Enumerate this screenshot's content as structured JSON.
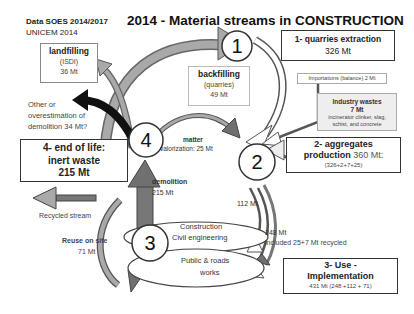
{
  "source": {
    "line1": "Data SOES 2014/2017",
    "line2": "UNICEM 2014"
  },
  "title": "2014 - Material streams in CONSTRUCTION",
  "nodes": {
    "n1": {
      "number": "1",
      "title": "1- quarries extraction",
      "value": "326 Mt"
    },
    "n2": {
      "number": "2",
      "title1": "2- aggregates",
      "title2": "production",
      "value": "360 Mt:",
      "formula": "(326+2+7+25)"
    },
    "n3": {
      "number": "3",
      "title1": "3- Use -",
      "title2": "Implementation",
      "value": "431 Mt  (248 +112 + 71)"
    },
    "n4": {
      "number": "4",
      "title1": "4- end of life:",
      "title2": "inert waste",
      "value": "215 Mt"
    }
  },
  "boxes": {
    "landfilling": {
      "title": "landfilling",
      "sub": "(ISDI)",
      "value": "36 Mt"
    },
    "backfilling": {
      "title": "backfilling",
      "sub": "(quarries)",
      "value": "49 Mt"
    },
    "importations": {
      "text": "Importations (balance) 2 Mt"
    },
    "industry": {
      "title": "Industry wastes",
      "value": "7 Mt",
      "desc1": "incinerator clinker, slag,",
      "desc2": "schist, and concrete"
    }
  },
  "labels": {
    "other1": "Other or",
    "other2": "overestimation of",
    "other3": "demolition  34 Mt?",
    "matter1": "matter",
    "matter2": "valorization: 25 Mt",
    "demolition1": "demolition",
    "demolition2": "215 Mt",
    "recycled": "Recycled stream",
    "reuse1": "Reuse  on site",
    "reuse2": "71 Mt",
    "flow112": "112 Mt",
    "flow248": "248 Mt",
    "included": "included 25+7 Mt recycled",
    "construction1": "Construction",
    "construction2": "Civil engineering",
    "public1": "Public & roads",
    "public2": "works"
  },
  "colors": {
    "grey_arrow": "#a9a9a9",
    "dark_arrow": "#111111",
    "dark_grey": "#707070",
    "outline": "#333333"
  }
}
